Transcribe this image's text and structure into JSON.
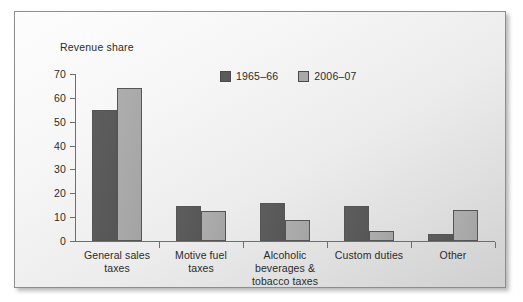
{
  "chart_data": {
    "type": "bar",
    "title": "",
    "ylabel": "Revenue share",
    "xlabel": "",
    "ylim": [
      0,
      70
    ],
    "yticks": [
      0,
      10,
      20,
      30,
      40,
      50,
      60,
      70
    ],
    "grid": false,
    "legend_position": "top-center",
    "categories": [
      "General sales taxes",
      "Motive fuel taxes",
      "Alcoholic beverages & tobacco taxes",
      "Custom duties",
      "Other"
    ],
    "category_lines": [
      [
        "General sales",
        "taxes"
      ],
      [
        "Motive fuel",
        "taxes"
      ],
      [
        "Alcoholic",
        "beverages &",
        "tobacco taxes"
      ],
      [
        "Custom duties"
      ],
      [
        "Other"
      ]
    ],
    "series": [
      {
        "name": "1965–66",
        "color": "#5a5a5a",
        "values": [
          55,
          14.5,
          16,
          14.5,
          3
        ]
      },
      {
        "name": "2006–07",
        "color": "#a9a9a9",
        "values": [
          64,
          12.5,
          9,
          4,
          13
        ]
      }
    ]
  },
  "axis": {
    "tick_labels": [
      "70",
      "60",
      "50",
      "40",
      "30",
      "20",
      "10",
      "0"
    ]
  },
  "legend": {
    "entries": [
      {
        "label": "1965–66",
        "swatch": "legend-swatch-dark"
      },
      {
        "label": "2006–07",
        "swatch": "legend-swatch-light"
      }
    ]
  }
}
